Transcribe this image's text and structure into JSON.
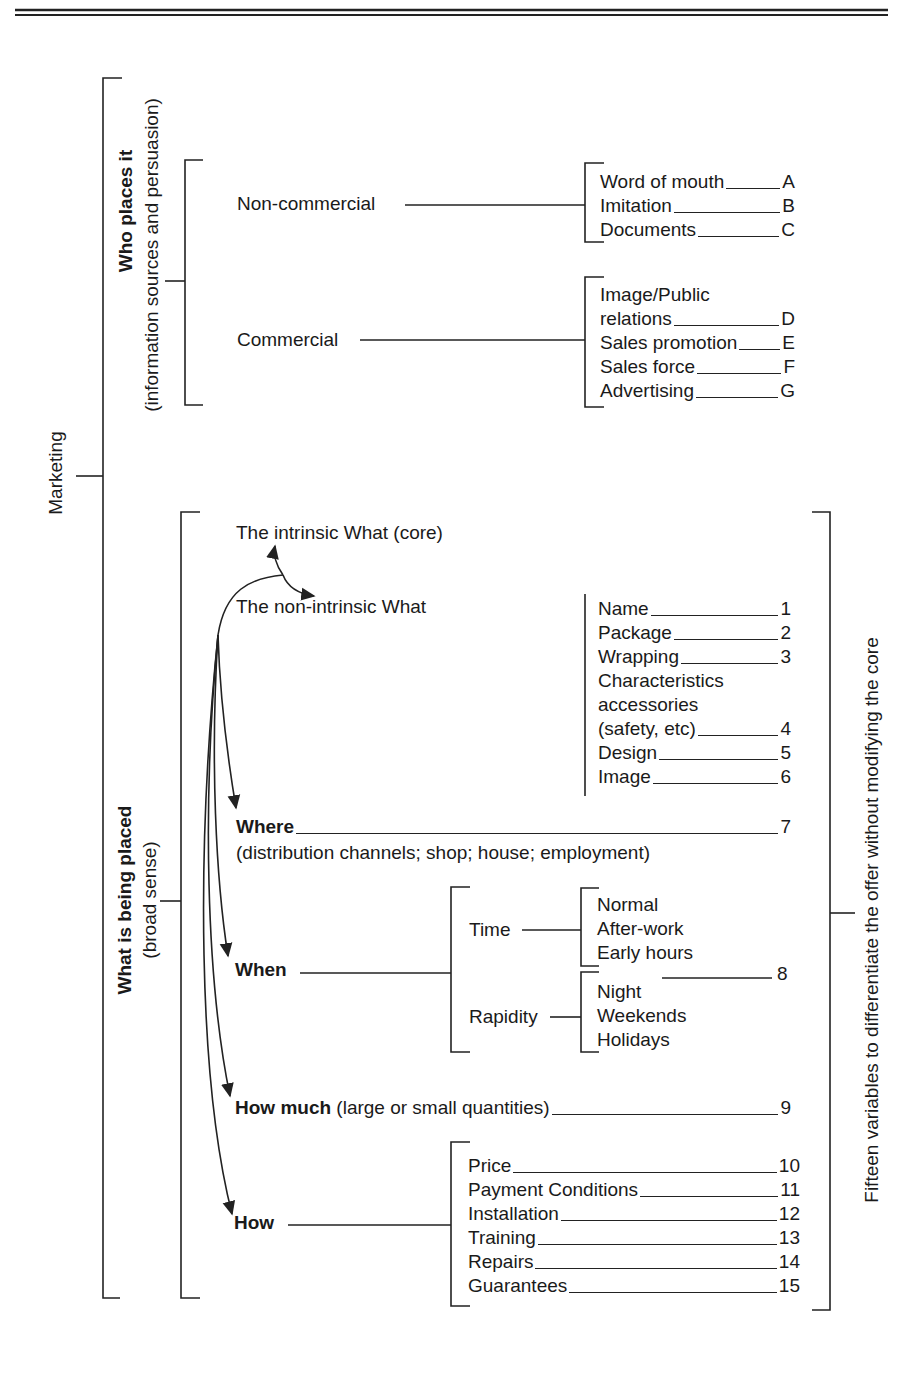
{
  "root": {
    "label": "Marketing"
  },
  "who": {
    "title": "Who places it",
    "subtitle": "(information sources and persuasion)",
    "noncommercial": {
      "label": "Non-commercial",
      "items": [
        {
          "label": "Word of mouth",
          "code": "A"
        },
        {
          "label": "Imitation",
          "code": "B"
        },
        {
          "label": "Documents",
          "code": "C"
        }
      ]
    },
    "commercial": {
      "label": "Commercial",
      "items": [
        {
          "label": "Image/Public",
          "code": ""
        },
        {
          "label": "relations",
          "code": "D"
        },
        {
          "label": "Sales promotion",
          "code": "E"
        },
        {
          "label": "Sales force",
          "code": "F"
        },
        {
          "label": "Advertising",
          "code": "G"
        }
      ]
    }
  },
  "what": {
    "title": "What is being placed",
    "subtitle": "(broad sense)",
    "intrinsic": "The intrinsic What (core)",
    "nonintrinsic": {
      "label": "The non-intrinsic What",
      "items": [
        {
          "label": "Name",
          "code": "1"
        },
        {
          "label": "Package",
          "code": "2"
        },
        {
          "label": "Wrapping",
          "code": "3"
        },
        {
          "label": "Characteristics",
          "code": ""
        },
        {
          "label": "accessories",
          "code": ""
        },
        {
          "label": "(safety, etc)",
          "code": "4"
        },
        {
          "label": "Design",
          "code": "5"
        },
        {
          "label": "Image",
          "code": "6"
        }
      ]
    },
    "where": {
      "label": "Where",
      "detail": "(distribution channels; shop; house; employment)",
      "code": "7"
    },
    "when": {
      "label": "When",
      "code": "8",
      "time": {
        "label": "Time",
        "items": [
          "Normal",
          "After-work",
          "Early hours"
        ]
      },
      "rapidity": {
        "label": "Rapidity",
        "items": [
          "Night",
          "Weekends",
          "Holidays"
        ]
      }
    },
    "howmuch": {
      "label": "How much",
      "detail": "(large or small quantities)",
      "code": "9"
    },
    "how": {
      "label": "How",
      "items": [
        {
          "label": "Price",
          "code": "10"
        },
        {
          "label": "Payment Conditions",
          "code": "11"
        },
        {
          "label": "Installation",
          "code": "12"
        },
        {
          "label": "Training",
          "code": "13"
        },
        {
          "label": "Repairs",
          "code": "14"
        },
        {
          "label": "Guarantees",
          "code": "15"
        }
      ]
    }
  },
  "right_label": "Fifteen variables to differentiate the offer without modifying the core"
}
